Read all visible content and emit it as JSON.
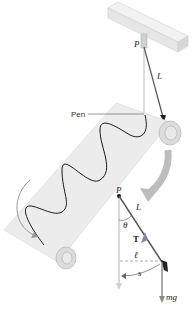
{
  "figure": {
    "top": {
      "pivot_label": "P",
      "length_label": "L",
      "pen_label": "Pen"
    },
    "fbd": {
      "pivot_label": "P",
      "length_label": "L",
      "angle_label": "θ",
      "tension_label": "T",
      "horizontal_label": "ℓ",
      "arc_label": "s",
      "weight_label": "mg"
    },
    "colors": {
      "paper": "#ececec",
      "wave": "#1a1a1a",
      "arrow_gray": "#b0b0b0",
      "string": "#555555",
      "tension": "#7a8aa0"
    }
  }
}
